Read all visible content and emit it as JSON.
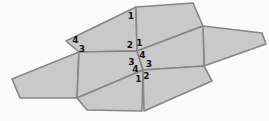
{
  "figure": {
    "width": 269,
    "height": 121,
    "background_color": "#fbfbfb",
    "tile_fill_color": "#c9c9c9",
    "edge_color": "#868686",
    "edge_width": 1.6,
    "label_color": "#141414",
    "faces": [
      {
        "name": "left-tile",
        "points": "79,52 12,79 20,98 77,98"
      },
      {
        "name": "top-left-tile",
        "points": "66,41 136,7 137,51 79,52"
      },
      {
        "name": "top-right-tile",
        "points": "136,7 193,3 203,26 137,51"
      },
      {
        "name": "right-tile",
        "points": "203,26 262,33 266,44 204,66"
      },
      {
        "name": "mid-left-tile",
        "points": "79,52 137,51 143,70 77,98"
      },
      {
        "name": "mid-right-tile",
        "points": "137,51 203,26 204,66 143,70"
      },
      {
        "name": "bottom-left-tile",
        "points": "77,98 143,70 142,111 87,110"
      },
      {
        "name": "bottom-right-tile",
        "points": "143,70 204,66 212,81 144,111"
      }
    ],
    "angle_labels": [
      {
        "text": "1",
        "x": 131,
        "y": 19,
        "position": "top-left-tile top-right corner"
      },
      {
        "text": "4",
        "x": 75.5,
        "y": 42.5,
        "position": "top-left-tile left point"
      },
      {
        "text": "3",
        "x": 82,
        "y": 51.5,
        "position": "top-left-tile bottom-left corner"
      },
      {
        "text": "2",
        "x": 130,
        "y": 48,
        "position": "upper central vertex, top-left tile"
      },
      {
        "text": "1",
        "x": 139.5,
        "y": 46,
        "position": "upper central vertex, top-right tile"
      },
      {
        "text": "4",
        "x": 142.5,
        "y": 58,
        "position": "upper central vertex, mid-right tile"
      },
      {
        "text": "3",
        "x": 131.5,
        "y": 64.5,
        "position": "upper central vertex, mid-left tile"
      },
      {
        "text": "3",
        "x": 149,
        "y": 66.5,
        "position": "lower central vertex, mid-right tile"
      },
      {
        "text": "4",
        "x": 135.5,
        "y": 72,
        "position": "lower central vertex, mid-left tile"
      },
      {
        "text": "1",
        "x": 138.5,
        "y": 81.5,
        "position": "lower central vertex, bottom-left tile"
      },
      {
        "text": "2",
        "x": 146.5,
        "y": 79,
        "position": "lower central vertex, bottom-right tile"
      }
    ]
  }
}
